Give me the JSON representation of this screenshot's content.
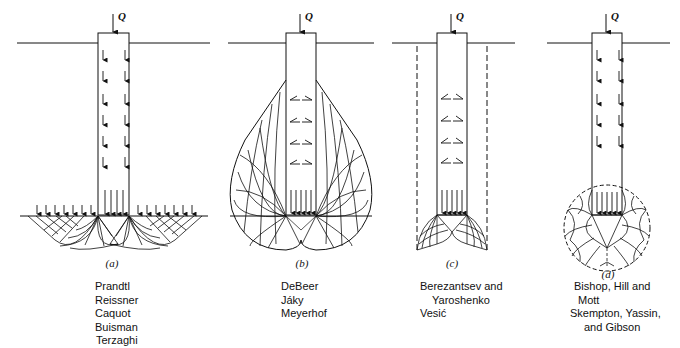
{
  "figure": {
    "load_symbol": "Q",
    "panels": [
      {
        "id": "a",
        "label": "(a)",
        "authors": [
          "Prandtl",
          "Reissner",
          "Caquot",
          "Buisman",
          "Terzaghi"
        ]
      },
      {
        "id": "b",
        "label": "(b)",
        "authors": [
          "DeBeer",
          "Jáky",
          "Meyerhof"
        ]
      },
      {
        "id": "c",
        "label": "(c)",
        "authors": [
          "Berezantsev and",
          "Yaroshenko",
          "Vesić"
        ]
      },
      {
        "id": "d",
        "label": "(d)",
        "authors": [
          "Bishop, Hill and",
          "Mott",
          "Skempton, Yassin,",
          "and Gibson"
        ]
      }
    ]
  }
}
